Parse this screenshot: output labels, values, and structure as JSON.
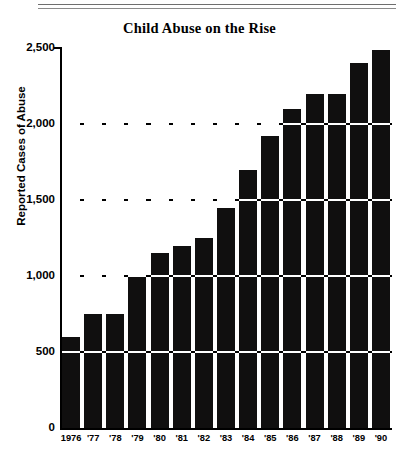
{
  "chart_data": {
    "type": "bar",
    "title": "Child Abuse on the Rise",
    "xlabel": "",
    "ylabel": "Reported Cases of Abuse",
    "categories": [
      "1976",
      "'77",
      "'78",
      "'79",
      "'80",
      "'81",
      "'82",
      "'83",
      "'84",
      "'85",
      "'86",
      "'87",
      "'88",
      "'89",
      "'90"
    ],
    "values": [
      600,
      750,
      750,
      1000,
      1150,
      1200,
      1250,
      1450,
      1700,
      1920,
      2100,
      2200,
      2200,
      2400,
      2490
    ],
    "ylim": [
      0,
      2500
    ],
    "ytick_values": [
      0,
      500,
      1000,
      1500,
      2000,
      2500
    ],
    "ytick_labels": [
      "0",
      "500",
      "1,000",
      "1,500",
      "2,000",
      "2,500"
    ],
    "gridlines_at": [
      500,
      1000,
      1500,
      2000
    ],
    "grid": true,
    "legend": "none",
    "bar_color": "#100f0f",
    "background_color": "#ffffff",
    "axis_color": "#000000"
  },
  "figure": {
    "title": "Child Abuse on the Rise",
    "y_axis_title": "Reported Cases of Abuse",
    "footnote": ""
  }
}
